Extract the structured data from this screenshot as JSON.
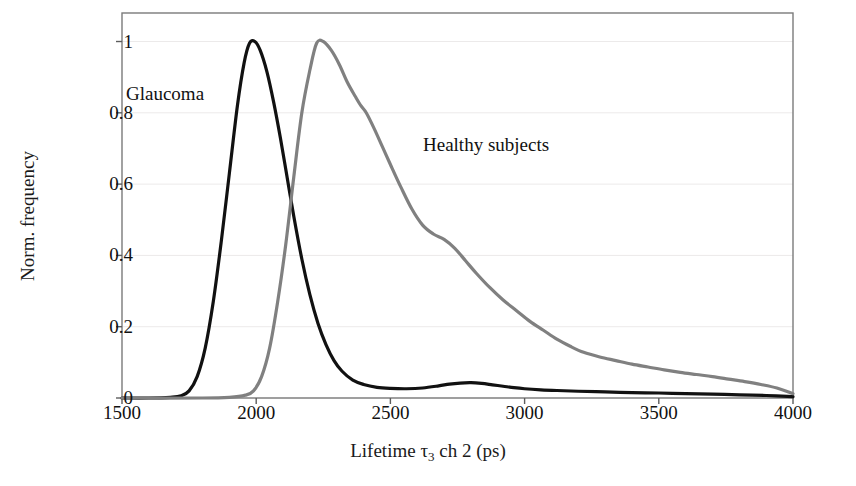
{
  "chart_data": {
    "type": "line",
    "title": "",
    "xlabel": "Lifetime τ₃ ch 2 (ps)",
    "xlabel_parts": {
      "prefix": "Lifetime τ",
      "sub": "3",
      "suffix": " ch 2 (ps)"
    },
    "ylabel": "Norm. frequency",
    "xlim": [
      1500,
      4000
    ],
    "ylim": [
      0,
      1.08
    ],
    "xticks": [
      1500,
      2000,
      2500,
      3000,
      3500,
      4000
    ],
    "xtick_labels": [
      "1500",
      "2000",
      "2500",
      "3000",
      "3500",
      "4000"
    ],
    "yticks": [
      0,
      0.2,
      0.4,
      0.6,
      0.8,
      1
    ],
    "ytick_labels": [
      "0",
      "0.2",
      "0.4",
      "0.6",
      "0.8",
      "1"
    ],
    "grid": "faint-horizontal",
    "legend_position": "inline-annotations",
    "series": [
      {
        "name": "Glaucoma",
        "color": "#111111",
        "linewidth": 3.2,
        "annotation_label": "Glaucoma",
        "x": [
          1500,
          1600,
          1680,
          1720,
          1750,
          1780,
          1810,
          1840,
          1870,
          1900,
          1930,
          1955,
          1975,
          1995,
          2015,
          2040,
          2065,
          2090,
          2115,
          2140,
          2170,
          2200,
          2230,
          2260,
          2290,
          2320,
          2360,
          2400,
          2450,
          2500,
          2560,
          2620,
          2680,
          2720,
          2760,
          2800,
          2840,
          2880,
          2920,
          2960,
          3000,
          3060,
          3120,
          3200,
          3300,
          3400,
          3500,
          3600,
          3700,
          3800,
          3900,
          4000
        ],
        "y": [
          0.0,
          0.0,
          0.002,
          0.006,
          0.02,
          0.06,
          0.14,
          0.27,
          0.44,
          0.63,
          0.82,
          0.94,
          0.995,
          1.0,
          0.975,
          0.915,
          0.83,
          0.73,
          0.62,
          0.51,
          0.39,
          0.29,
          0.21,
          0.15,
          0.105,
          0.075,
          0.05,
          0.038,
          0.03,
          0.027,
          0.026,
          0.028,
          0.034,
          0.039,
          0.042,
          0.043,
          0.041,
          0.037,
          0.033,
          0.029,
          0.026,
          0.023,
          0.021,
          0.019,
          0.017,
          0.015,
          0.014,
          0.012,
          0.011,
          0.009,
          0.007,
          0.004
        ]
      },
      {
        "name": "Healthy subjects",
        "color": "#808080",
        "linewidth": 3.2,
        "annotation_label": "Healthy subjects",
        "x": [
          1500,
          1800,
          1900,
          1960,
          1990,
          2020,
          2050,
          2080,
          2110,
          2140,
          2170,
          2200,
          2225,
          2250,
          2280,
          2310,
          2340,
          2370,
          2390,
          2410,
          2440,
          2470,
          2500,
          2540,
          2580,
          2620,
          2660,
          2700,
          2740,
          2780,
          2820,
          2870,
          2920,
          2970,
          3020,
          3070,
          3120,
          3170,
          3220,
          3280,
          3340,
          3400,
          3460,
          3520,
          3580,
          3640,
          3700,
          3760,
          3820,
          3880,
          3940,
          4000
        ],
        "y": [
          0.0,
          0.0,
          0.002,
          0.008,
          0.02,
          0.06,
          0.14,
          0.27,
          0.43,
          0.62,
          0.8,
          0.92,
          0.995,
          1.0,
          0.975,
          0.935,
          0.885,
          0.845,
          0.82,
          0.8,
          0.755,
          0.705,
          0.655,
          0.59,
          0.53,
          0.485,
          0.46,
          0.445,
          0.42,
          0.385,
          0.35,
          0.31,
          0.275,
          0.245,
          0.215,
          0.19,
          0.165,
          0.145,
          0.128,
          0.115,
          0.105,
          0.095,
          0.087,
          0.079,
          0.072,
          0.066,
          0.06,
          0.053,
          0.046,
          0.038,
          0.028,
          0.012
        ]
      }
    ]
  },
  "axes_geometry": {
    "left_px": 122,
    "right_px": 793,
    "top_px": 13,
    "bottom_px": 398
  }
}
